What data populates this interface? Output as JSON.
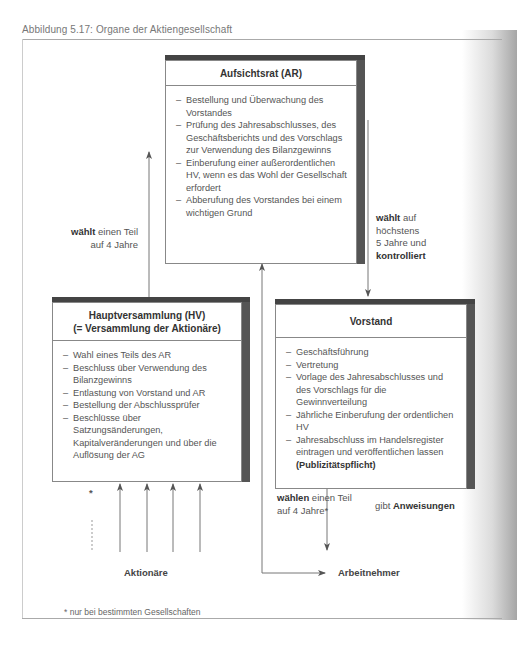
{
  "caption": "Abbildung 5.17:  Organe der Aktiengesellschaft",
  "boxes": {
    "aufsichtsrat": {
      "title": "Aufsichtsrat (AR)",
      "items": [
        "Bestellung und Überwachung des Vorstandes",
        "Prüfung des Jahresabschlusses, des Geschäftsberichts und des Vorschlags zur Verwendung des Bilanzgewinns",
        "Einberufung einer außerordentlichen HV, wenn es das Wohl der Gesellschaft erfordert",
        "Abberufung des Vorstandes bei einem wichtigen Grund"
      ]
    },
    "hauptversammlung": {
      "title_line1": "Hauptversammlung (HV)",
      "title_line2": "(= Versammlung der Aktionäre)",
      "items": [
        "Wahl eines Teils des AR",
        "Beschluss über Verwendung des Bilanzgewinns",
        "Entlastung von Vorstand und AR",
        "Bestellung der Abschlussprüfer",
        "Beschlüsse über Satzungsänderungen, Kapitalveränderungen und über die Auflösung der AG"
      ]
    },
    "vorstand": {
      "title": "Vorstand",
      "items": [
        "Geschäftsführung",
        "Vertretung",
        "Vorlage des Jahresabschlusses und des Vorschlags für die Gewinnverteilung",
        "Jährliche Einberufung der ordentlichen HV",
        "Jahresabschluss im Handelsregister eintragen und veröffentlichen lassen"
      ],
      "emphasis": "(Publizitätspflicht)"
    }
  },
  "labels": {
    "hv_to_ar": {
      "bold": "wählt",
      "line1_rest": " einen Teil",
      "line2": "auf 4 Jahre"
    },
    "ar_to_vorstand": {
      "bold_1": "wählt",
      "line1_rest": " auf",
      "line2": "höchstens",
      "line3": "5 Jahre und",
      "bold_2": "kontrolliert"
    },
    "arbeitnehmer_to_ar": {
      "bold": "wählen",
      "line1_rest": " einen Teil",
      "line2": "auf 4 Jahre*"
    },
    "vorstand_to_arbeitnehmer": {
      "prefix": "gibt ",
      "bold": "Anweisungen"
    },
    "aktionaere": "Aktionäre",
    "arbeitnehmer": "Arbeitnehmer",
    "asterisk": "*"
  },
  "footnote": "* nur bei bestimmten Gesellschaften"
}
